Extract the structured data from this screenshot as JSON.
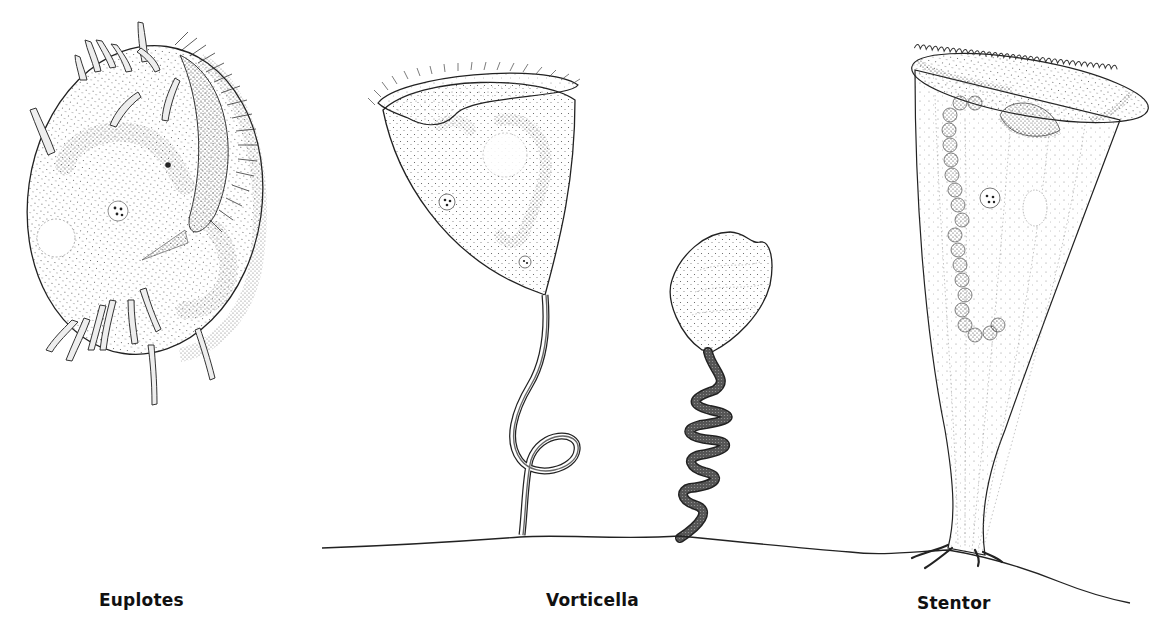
{
  "figure": {
    "organisms": [
      {
        "id": "euplotes",
        "label": "Euplotes"
      },
      {
        "id": "vorticella",
        "label": "Vorticella"
      },
      {
        "id": "stentor",
        "label": "Stentor"
      }
    ],
    "colors": {
      "background": "#ffffff",
      "ink": "#1a1a1a",
      "stipple": "#555555",
      "label": "#111111"
    }
  }
}
